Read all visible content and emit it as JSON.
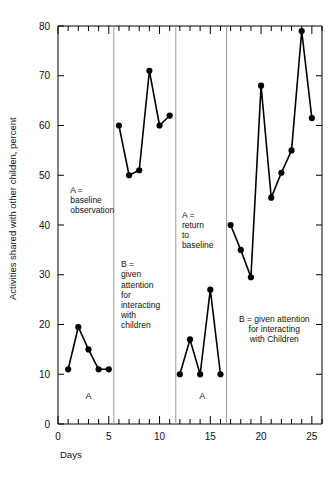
{
  "chart_data": {
    "type": "line",
    "title": "",
    "subtitle": "",
    "xlabel": "Days",
    "ylabel": "Activities shared with other childen, percent",
    "xlim": [
      0,
      26
    ],
    "ylim": [
      0,
      80
    ],
    "grid": false,
    "legend": "none",
    "x_ticks_major": [
      0,
      5,
      10,
      15,
      20,
      25
    ],
    "x_tick_labels": [
      "0",
      "5",
      "10",
      "15",
      "20",
      "25"
    ],
    "x_tick_minor_step": 1,
    "y_ticks_major": [
      0,
      10,
      20,
      30,
      40,
      50,
      60,
      70,
      80
    ],
    "y_tick_labels": [
      "0",
      "10",
      "20",
      "30",
      "40",
      "50",
      "60",
      "70",
      "80"
    ],
    "marker": "filled-circle",
    "line_color": "#000000",
    "marker_color": "#000000",
    "phase_divider_color": "#9a9a9a",
    "phase_dividers_x": [
      5.5,
      11.6,
      16.6
    ],
    "series": [
      {
        "name": "Phase A1 baseline",
        "x": [
          1,
          2,
          3,
          4,
          5
        ],
        "values": [
          11,
          19.5,
          15,
          11,
          11
        ]
      },
      {
        "name": "Phase B1 attention",
        "x": [
          6,
          7,
          8,
          9,
          10,
          11
        ],
        "values": [
          60,
          50,
          51,
          71,
          60,
          62
        ]
      },
      {
        "name": "Phase A2 return to baseline",
        "x": [
          12,
          13,
          14,
          15,
          16
        ],
        "values": [
          10,
          17,
          10,
          27,
          10
        ]
      },
      {
        "name": "Phase B2 attention",
        "x": [
          17,
          18,
          19,
          20,
          21,
          22,
          23,
          24,
          25
        ],
        "values": [
          40,
          35,
          29.5,
          68,
          45.5,
          50.5,
          55,
          79,
          61.5
        ]
      }
    ],
    "phase_letters": [
      {
        "label": "A",
        "x": 3.0,
        "y": 5
      },
      {
        "label": "A",
        "x": 14.2,
        "y": 5
      }
    ],
    "annotations": [
      {
        "id": "annot-a-baseline",
        "lines": [
          "A =",
          "baseline",
          "observation"
        ],
        "x": 1.2,
        "y": 46.5,
        "align": "left"
      },
      {
        "id": "annot-b-attention-1",
        "lines": [
          "B =",
          "given",
          "attention",
          "for",
          "interacting",
          "with",
          "children"
        ],
        "x": 6.2,
        "y": 31.5,
        "align": "left"
      },
      {
        "id": "annot-a-return",
        "lines": [
          "A =",
          "return",
          "to",
          "baseline"
        ],
        "x": 12.2,
        "y": 41.5,
        "align": "left"
      },
      {
        "id": "annot-b-attention-2",
        "lines": [
          "B = given attention",
          "for interacting",
          "with Children"
        ],
        "x": 21.3,
        "y": 20.5,
        "align": "center"
      }
    ]
  }
}
